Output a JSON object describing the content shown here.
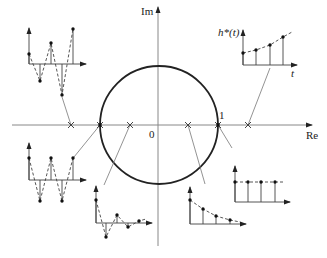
{
  "diagram": {
    "axes": {
      "real_label": "Re",
      "imag_label": "Im",
      "origin_label": "0",
      "unit_label": "1"
    },
    "response_labels": {
      "y_label": "h*(t)",
      "x_label": "t"
    },
    "unit_circle": {
      "cx": 159,
      "cy": 125,
      "r": 59
    },
    "poles": [
      {
        "id": "outside-negative",
        "x": 71,
        "description": "Real pole < -1: alternating, growing"
      },
      {
        "id": "on-circle-negative",
        "x": 100,
        "description": "Pole at -1: alternating, constant amplitude"
      },
      {
        "id": "inside-negative",
        "x": 130,
        "description": "Real pole in (-1,0): alternating, decaying"
      },
      {
        "id": "inside-positive",
        "x": 188,
        "description": "Real pole in (0,1): monotonic decay"
      },
      {
        "id": "on-circle-positive",
        "x": 218,
        "description": "Pole at 1: constant"
      },
      {
        "id": "outside-positive",
        "x": 248,
        "description": "Real pole > 1: monotonic growth"
      }
    ],
    "responses": [
      {
        "id": "alt-growing",
        "origin": [
          29,
          64
        ],
        "arrow_top": 28,
        "axis_end": 86,
        "points": [
          [
            29,
            54
          ],
          [
            40,
            81
          ],
          [
            51,
            43
          ],
          [
            62,
            95
          ],
          [
            73,
            29
          ]
        ],
        "connector": [
          [
            71,
            125
          ],
          [
            62,
            97
          ]
        ]
      },
      {
        "id": "alt-constant",
        "origin": [
          29,
          180
        ],
        "arrow_top": 143,
        "axis_end": 86,
        "points": [
          [
            29,
            158
          ],
          [
            40,
            201
          ],
          [
            51,
            158
          ],
          [
            62,
            201
          ],
          [
            73,
            158
          ]
        ],
        "connector": [
          [
            100,
            125
          ],
          [
            74,
            157
          ]
        ]
      },
      {
        "id": "alt-decaying",
        "origin": [
          96,
          223
        ],
        "arrow_top": 186,
        "axis_end": 152,
        "points": [
          [
            96,
            200
          ],
          [
            106,
            237
          ],
          [
            117,
            215
          ],
          [
            128,
            227
          ],
          [
            139,
            221
          ]
        ],
        "connector": [
          [
            130,
            125
          ],
          [
            104,
            185
          ]
        ]
      },
      {
        "id": "decaying",
        "origin": [
          190,
          224
        ],
        "arrow_top": 187,
        "axis_end": 246,
        "points": [
          [
            190,
            200
          ],
          [
            203,
            209
          ],
          [
            216,
            216
          ],
          [
            230,
            220
          ]
        ],
        "connector": [
          [
            188,
            125
          ],
          [
            205,
            184
          ]
        ]
      },
      {
        "id": "constant",
        "origin": [
          235,
          202
        ],
        "arrow_top": 166,
        "axis_end": 290,
        "points": [
          [
            235,
            182
          ],
          [
            248,
            182
          ],
          [
            261,
            182
          ],
          [
            275,
            182
          ]
        ],
        "connector": [
          [
            218,
            125
          ],
          [
            232,
            148
          ]
        ]
      },
      {
        "id": "growing",
        "origin": [
          243,
          65
        ],
        "arrow_top": 30,
        "axis_end": 297,
        "points": [
          [
            243,
            53
          ],
          [
            256,
            50
          ],
          [
            270,
            45
          ],
          [
            283,
            37
          ]
        ],
        "connector": [
          [
            248,
            125
          ],
          [
            270,
            68
          ]
        ]
      }
    ]
  }
}
